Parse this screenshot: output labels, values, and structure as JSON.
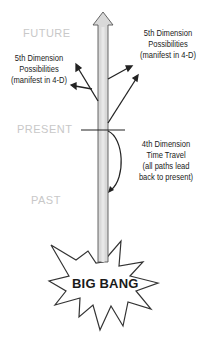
{
  "diagram": {
    "era_labels": {
      "future": "FUTURE",
      "present": "PRESENT",
      "past": "PAST"
    },
    "left_note": {
      "line1": "5th Dimension",
      "line2": "Possibilities",
      "line3": "(manifest in 4-D)"
    },
    "right_note": {
      "line1": "5th Dimension",
      "line2": "Possibilities",
      "line3": "(manifest in 4-D)"
    },
    "time_travel_note": {
      "line1": "4th Dimension",
      "line2": "Time Travel",
      "line3": "(all paths lead",
      "line4": "back to present)"
    },
    "origin_label": "BIG BANG",
    "colors": {
      "era_text": "#c8c8c8",
      "shaft_fill": "#d9d9d9",
      "outline": "#333333",
      "text": "#222222"
    }
  }
}
